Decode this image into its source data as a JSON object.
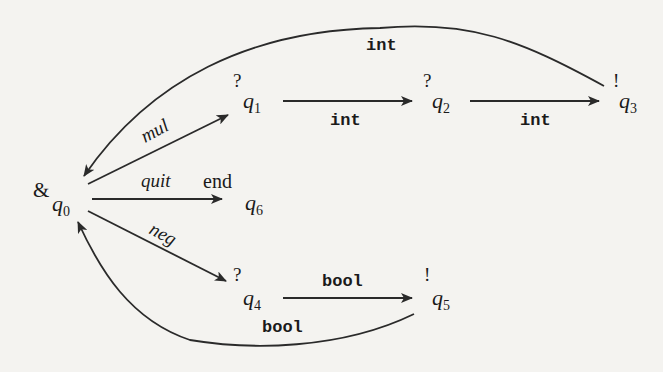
{
  "diagram": {
    "type": "state-machine",
    "states": [
      {
        "id": "q0",
        "name": "q",
        "index": "0",
        "marker": "&"
      },
      {
        "id": "q1",
        "name": "q",
        "index": "1",
        "marker": "?"
      },
      {
        "id": "q2",
        "name": "q",
        "index": "2",
        "marker": "?"
      },
      {
        "id": "q3",
        "name": "q",
        "index": "3",
        "marker": "!"
      },
      {
        "id": "q4",
        "name": "q",
        "index": "4",
        "marker": "?"
      },
      {
        "id": "q5",
        "name": "q",
        "index": "5",
        "marker": "!"
      },
      {
        "id": "q6",
        "name": "q",
        "index": "6",
        "marker": "end"
      }
    ],
    "edges": [
      {
        "from": "q0",
        "to": "q1",
        "label": "mul"
      },
      {
        "from": "q1",
        "to": "q2",
        "label": "int"
      },
      {
        "from": "q2",
        "to": "q3",
        "label": "int"
      },
      {
        "from": "q3",
        "to": "q0",
        "label": "int"
      },
      {
        "from": "q0",
        "to": "q6",
        "label": "quit"
      },
      {
        "from": "q0",
        "to": "q4",
        "label": "neg"
      },
      {
        "from": "q4",
        "to": "q5",
        "label": "bool"
      },
      {
        "from": "q5",
        "to": "q0",
        "label": "bool"
      }
    ]
  }
}
